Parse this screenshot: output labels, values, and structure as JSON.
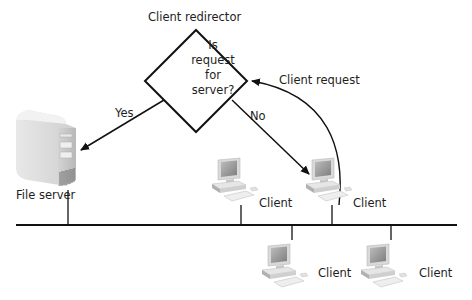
{
  "diagram": {
    "title": "Client redirector",
    "decision": {
      "lines": [
        "Is",
        "request",
        "for",
        "server?"
      ]
    },
    "edges": {
      "yes_label": "Yes",
      "no_label": "No",
      "client_request_label": "Client request"
    },
    "server": {
      "label": "File server"
    },
    "clients": [
      {
        "label": "Client",
        "position": "top-left"
      },
      {
        "label": "Client",
        "position": "top-right"
      },
      {
        "label": "Client",
        "position": "bottom-left"
      },
      {
        "label": "Client",
        "position": "bottom-right"
      }
    ],
    "colors": {
      "line": "#111111",
      "server_body": "#dcdcdc",
      "monitor_screen": "#9a9a9a"
    }
  }
}
